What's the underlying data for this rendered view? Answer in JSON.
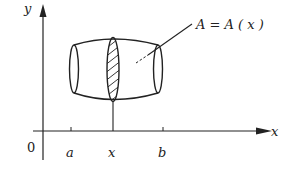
{
  "diagram": {
    "type": "solid-of-known-cross-section",
    "axes": {
      "x_label": "x",
      "y_label": "y",
      "origin_label": "0"
    },
    "ticks": [
      {
        "label": "a"
      },
      {
        "label": "x"
      },
      {
        "label": "b"
      }
    ],
    "annotation": {
      "text": "A = A ( x )"
    },
    "colors": {
      "stroke": "#222222",
      "background": "#ffffff"
    }
  }
}
